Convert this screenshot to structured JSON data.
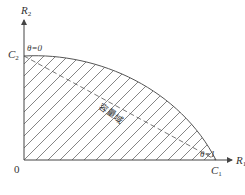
{
  "diagram": {
    "type": "capacity-region",
    "axes": {
      "x": {
        "label": "R",
        "subscript": "1"
      },
      "y": {
        "label": "R",
        "subscript": "2"
      },
      "origin": "0"
    },
    "intercepts": {
      "x": {
        "label": "C",
        "subscript": "1",
        "theta_label": "θ=1"
      },
      "y": {
        "label": "C",
        "subscript": "2",
        "theta_label": "θ=0"
      }
    },
    "region_label": "容量域",
    "colors": {
      "stroke": "#555555",
      "hatch": "#666666",
      "background": "#ffffff"
    }
  }
}
